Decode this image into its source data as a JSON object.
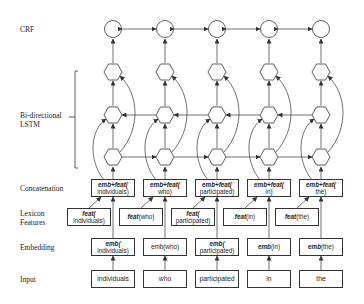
{
  "row_labels": {
    "crf": "CRF",
    "lstm": "Bi-directional\nLSTM",
    "concat": "Concatenation",
    "lexicon": "Lexicon\nFeatures",
    "embedding": "Embedding",
    "input": "Input"
  },
  "tokens": [
    "individuals",
    "who",
    "participated",
    "in",
    "the"
  ],
  "concatenation": [
    {
      "prefix": "emb+feat(",
      "suffix": "individuals)"
    },
    {
      "prefix": "emb+feat(",
      "suffix": "who)"
    },
    {
      "prefix": "emb+feat(",
      "suffix": "participated)"
    },
    {
      "prefix": "emb+feat(",
      "suffix": "in)"
    },
    {
      "prefix": "emb+feat(",
      "suffix": "the)"
    }
  ],
  "lexicon": [
    {
      "prefix": "feat(",
      "suffix": "individuals)"
    },
    {
      "prefix": "feat",
      "suffix": "(who)"
    },
    {
      "prefix": "feat(",
      "suffix": "participated)"
    },
    {
      "prefix": "feat",
      "suffix": "(in)"
    },
    {
      "prefix": "feat",
      "suffix": "(the)"
    }
  ],
  "embedding": [
    {
      "prefix": "emb(",
      "suffix": "individuals)"
    },
    {
      "prefix": "",
      "suffix": "emb(who)"
    },
    {
      "prefix": "emb(",
      "suffix": "participated)"
    },
    {
      "prefix": "emb",
      "suffix": "(in)"
    },
    {
      "prefix": "emb",
      "suffix": "(the)"
    }
  ],
  "input": {
    "items": [
      "individuals",
      "who",
      "participated",
      "in",
      "the"
    ]
  },
  "colors": {
    "stroke": "#333333",
    "text": "#222222",
    "background": "#ffffff"
  }
}
